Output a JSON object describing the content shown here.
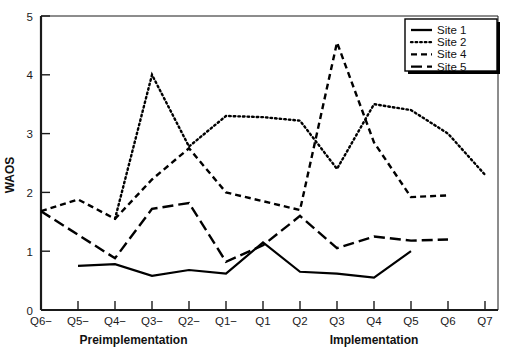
{
  "chart_data": {
    "type": "line",
    "title": "",
    "xlabel": "",
    "ylabel": "WAOS",
    "ylim": [
      0,
      5
    ],
    "yticks": [
      0,
      1,
      2,
      3,
      4,
      5
    ],
    "grid": false,
    "legend_position": "top-right",
    "categories": [
      "Q6−",
      "Q5−",
      "Q4−",
      "Q3−",
      "Q2−",
      "Q1−",
      "Q1",
      "Q2",
      "Q3",
      "Q4",
      "Q5",
      "Q6",
      "Q7"
    ],
    "x_group_labels": [
      {
        "label": "Preimplementation",
        "from": "Q6−",
        "to": "Q1−"
      },
      {
        "label": "Implementation",
        "from": "Q1",
        "to": "Q7"
      }
    ],
    "series": [
      {
        "name": "Site 1",
        "style": "solid",
        "values": [
          null,
          0.75,
          0.78,
          0.58,
          0.68,
          0.62,
          1.15,
          0.65,
          0.62,
          0.55,
          1.0,
          null,
          null
        ]
      },
      {
        "name": "Site 2",
        "style": "dotted",
        "values": [
          null,
          null,
          1.55,
          4.0,
          2.78,
          3.3,
          3.28,
          3.22,
          2.4,
          3.5,
          3.4,
          3.0,
          2.3
        ]
      },
      {
        "name": "Site 4",
        "style": "dashed",
        "values": [
          1.68,
          1.88,
          1.55,
          2.22,
          2.75,
          2.0,
          1.85,
          1.7,
          4.55,
          2.85,
          1.92,
          1.95,
          null
        ]
      },
      {
        "name": "Site 5",
        "style": "long-dash",
        "values": [
          1.68,
          1.28,
          0.88,
          1.72,
          1.82,
          0.82,
          1.1,
          1.6,
          1.05,
          1.25,
          1.18,
          1.2,
          null
        ]
      }
    ]
  },
  "legend": {
    "items": [
      {
        "label": "Site 1"
      },
      {
        "label": "Site 2"
      },
      {
        "label": "Site 4"
      },
      {
        "label": "Site 5"
      }
    ]
  }
}
